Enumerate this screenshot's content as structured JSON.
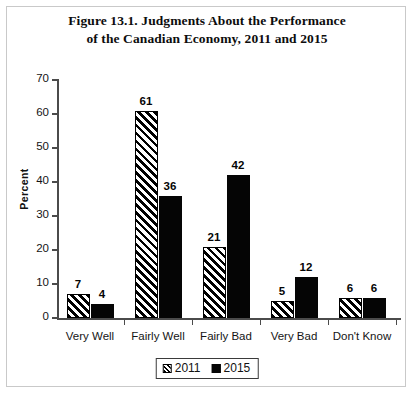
{
  "figure": {
    "title_line1": "Figure 13.1. Judgments About the Performance",
    "title_line2": "of the Canadian Economy, 2011 and 2015"
  },
  "chart_data": {
    "type": "bar",
    "title": "Figure 13.1. Judgments About the Performance of the Canadian Economy, 2011 and 2015",
    "xlabel": "",
    "ylabel": "Percent",
    "ylim": [
      0,
      70
    ],
    "yticks": [
      0,
      10,
      20,
      30,
      40,
      50,
      60,
      70
    ],
    "grid": false,
    "legend_position": "bottom-center",
    "categories": [
      "Very Well",
      "Fairly Well",
      "Fairly Bad",
      "Very Bad",
      "Don't Know"
    ],
    "series": [
      {
        "name": "2011",
        "values": [
          7,
          61,
          21,
          5,
          6
        ],
        "fill": "hatched-diagonal",
        "color": "#000000"
      },
      {
        "name": "2015",
        "values": [
          4,
          36,
          42,
          12,
          6
        ],
        "fill": "solid",
        "color": "#050505"
      }
    ]
  },
  "legend": {
    "items": [
      {
        "label": "2011",
        "swatch": "hatch-swatch-icon"
      },
      {
        "label": "2015",
        "swatch": "solid-swatch-icon"
      }
    ]
  }
}
